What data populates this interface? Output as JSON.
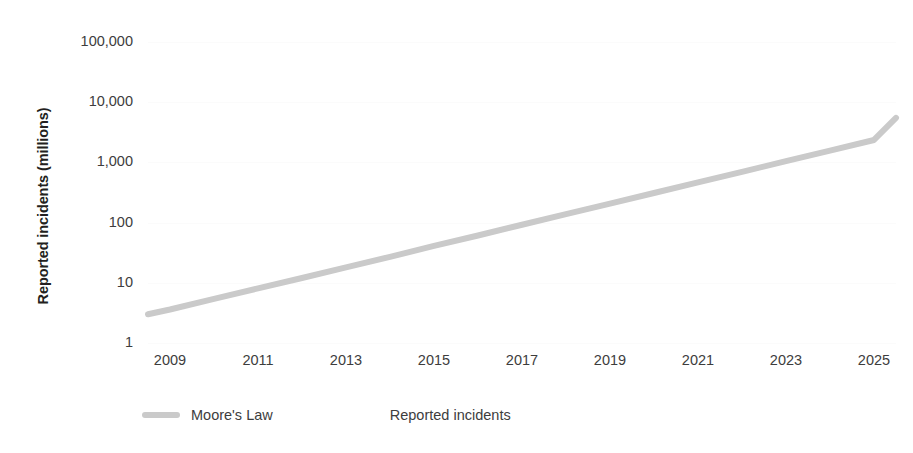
{
  "chart_data": {
    "type": "line",
    "title": "",
    "subtitle": "",
    "xlabel": "",
    "ylabel": "Reported incidents (millions)",
    "yscale": "log",
    "ylim": [
      1,
      100000
    ],
    "xlim": [
      2008.5,
      2025.5
    ],
    "grid": true,
    "grid_color": "#fbfbfb",
    "legend_position": "bottom-left",
    "y_tick_labels": [
      "100,000",
      "10,000",
      "1,000",
      "100",
      "10",
      "1"
    ],
    "y_tick_values": [
      100000,
      10000,
      1000,
      100,
      10,
      1
    ],
    "x_tick_labels": [
      "2009",
      "2011",
      "2013",
      "2015",
      "2017",
      "2019",
      "2021",
      "2023",
      "2025"
    ],
    "x_tick_values": [
      2009,
      2011,
      2013,
      2015,
      2017,
      2019,
      2021,
      2023,
      2025
    ],
    "series": [
      {
        "name": "Moore's Law",
        "color": "#cacaca",
        "line_width": 6,
        "x": [
          2008.5,
          2009,
          2010,
          2011,
          2012,
          2013,
          2014,
          2015,
          2016,
          2017,
          2018,
          2019,
          2020,
          2021,
          2022,
          2023,
          2024,
          2025,
          2025.5
        ],
        "values": [
          3,
          3.6,
          5.4,
          8.1,
          12,
          18,
          27,
          41,
          61,
          92,
          138,
          207,
          310,
          466,
          698,
          1048,
          1571,
          2357,
          5500
        ]
      },
      {
        "name": "Reported incidents",
        "color": "#ffffff",
        "line_width": 0,
        "x": [],
        "values": []
      }
    ],
    "legend_entries": [
      {
        "label": "Moore's Law",
        "color": "#cacaca",
        "has_swatch": true
      },
      {
        "label": "Reported incidents",
        "color": "#ffffff",
        "has_swatch": false
      }
    ]
  },
  "axes": {
    "y_title": "Reported incidents (millions)"
  },
  "legend": {
    "moores_law_label": "Moore's Law",
    "reported_incidents_label": "Reported incidents"
  }
}
